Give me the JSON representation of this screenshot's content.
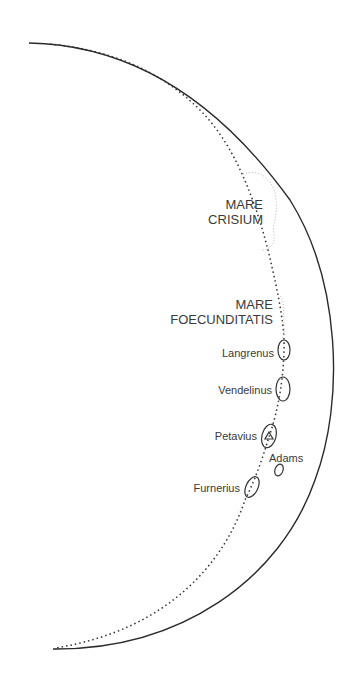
{
  "diagram": {
    "type": "lunar crescent map",
    "mare_labels": [
      {
        "line1": "MARE",
        "line2": "CRISIUM"
      },
      {
        "line1": "MARE",
        "line2": "FOECUNDITATIS"
      }
    ],
    "craters": [
      {
        "name": "Langrenus"
      },
      {
        "name": "Vendelinus"
      },
      {
        "name": "Petavius",
        "marker": "triangle"
      },
      {
        "name": "Adams"
      },
      {
        "name": "Furnerius"
      }
    ]
  }
}
